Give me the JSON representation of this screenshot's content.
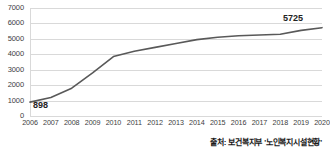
{
  "chart_data": {
    "type": "line",
    "title": "",
    "subtitle": "",
    "xlabel": "",
    "ylabel": "",
    "categories": [
      "2006",
      "2007",
      "2008",
      "2009",
      "2010",
      "2011",
      "2012",
      "2013",
      "2014",
      "2015",
      "2016",
      "2017",
      "2018",
      "2019",
      "2020"
    ],
    "values": [
      898,
      1200,
      1800,
      2800,
      3850,
      4200,
      4450,
      4700,
      4950,
      5100,
      5200,
      5250,
      5300,
      5550,
      5725
    ],
    "series": [
      {
        "name": "노인복지시설 수",
        "values": [
          898,
          1200,
          1800,
          2800,
          3850,
          4200,
          4450,
          4700,
          4950,
          5100,
          5200,
          5250,
          5300,
          5550,
          5725
        ]
      }
    ],
    "ylim": [
      0,
      7000
    ],
    "yticks": [
      0,
      1000,
      2000,
      3000,
      4000,
      5000,
      6000,
      7000
    ],
    "ytick_labels": [
      "0",
      "1000",
      "2000",
      "3000",
      "4000",
      "5000",
      "6000",
      "7000"
    ],
    "xlim": [
      "2006",
      "2020"
    ],
    "grid": true,
    "grid_axis": "y",
    "legend": false,
    "legend_position": "none",
    "line_color": "#595959",
    "data_labels": [
      {
        "category": "2006",
        "value": 898,
        "text": "898"
      },
      {
        "category": "2020",
        "value": 5725,
        "text": "5725"
      }
    ],
    "annotations": {
      "first_point_label": "898",
      "last_point_label": "5725"
    }
  },
  "axis": {
    "y_ticks": [
      "7000",
      "6000",
      "5000",
      "4000",
      "3000",
      "2000",
      "1000",
      "0"
    ],
    "x_ticks": [
      "2006",
      "2007",
      "2008",
      "2009",
      "2010",
      "2011",
      "2012",
      "2013",
      "2014",
      "2015",
      "2016",
      "2017",
      "2018",
      "2019",
      "2020"
    ]
  },
  "footer": {
    "source": "출처: 보건복지부 '노인복지시설현황'"
  },
  "colors": {
    "line": "#595959",
    "grid": "#d9d9d9",
    "text": "#404040",
    "label_text": "#222222",
    "background": "#ffffff"
  }
}
